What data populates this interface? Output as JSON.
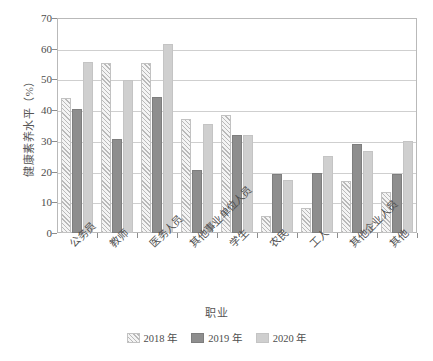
{
  "chart_data": {
    "type": "bar",
    "title": "",
    "xlabel": "职业",
    "ylabel": "健康素养水平（%）",
    "ylim": [
      0,
      70
    ],
    "yticks": [
      0,
      10,
      20,
      30,
      40,
      50,
      60,
      70
    ],
    "grid": true,
    "legend_position": "bottom",
    "categories": [
      "公务员",
      "教师",
      "医务人员",
      "其他事业单位人员",
      "学生",
      "农民",
      "工人",
      "其他企业人员",
      "其他"
    ],
    "series": [
      {
        "name": "2018 年",
        "color": "#e9e9e9",
        "pattern": "diagonal-hatch",
        "values": [
          43.8,
          55.5,
          55.5,
          37.2,
          38.5,
          5.6,
          8.1,
          17.0,
          13.4
        ]
      },
      {
        "name": "2019 年",
        "color": "#8e8e8e",
        "pattern": "solid",
        "values": [
          40.4,
          30.5,
          44.4,
          20.5,
          32.0,
          19.2,
          19.6,
          28.9,
          19.1
        ]
      },
      {
        "name": "2020 年",
        "color": "#cfcfcf",
        "pattern": "solid",
        "values": [
          55.7,
          49.9,
          61.6,
          35.6,
          32.0,
          17.4,
          25.2,
          26.6,
          30.0
        ]
      }
    ]
  },
  "axes": {
    "y_tick_labels": [
      "0",
      "10",
      "20",
      "30",
      "40",
      "50",
      "60",
      "70"
    ],
    "y_axis_title": "健康素养水平（%）",
    "x_axis_title": "职业"
  },
  "legend": {
    "items": [
      {
        "label": "2018 年",
        "color": "#e9e9e9"
      },
      {
        "label": "2019 年",
        "color": "#8e8e8e"
      },
      {
        "label": "2020 年",
        "color": "#cfcfcf"
      }
    ]
  }
}
